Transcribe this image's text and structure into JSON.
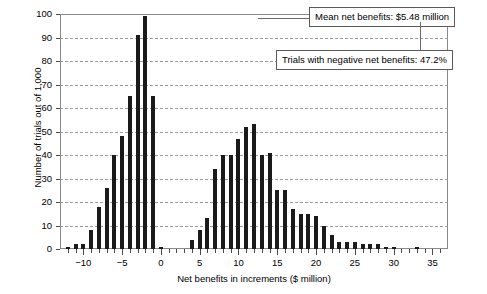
{
  "chart_data": {
    "type": "bar",
    "title": "",
    "subtitle": "",
    "xlabel": "Net benefits in increments ($ million)",
    "ylabel": "Number of trials out of 1,000",
    "xlim": [
      -13,
      37
    ],
    "ylim": [
      0,
      100
    ],
    "grid": true,
    "legend_position": "none",
    "x_tick_labels": [
      "-10",
      "-5",
      "0",
      "5",
      "10",
      "15",
      "20",
      "25",
      "30",
      "35"
    ],
    "x_tick_values": [
      -10,
      -5,
      0,
      5,
      10,
      15,
      20,
      25,
      30,
      35
    ],
    "x_minor_tick_step": 1,
    "y_tick_labels": [
      "0",
      "10",
      "20",
      "30",
      "40",
      "50",
      "60",
      "70",
      "80",
      "90",
      "100"
    ],
    "y_tick_values": [
      0,
      10,
      20,
      30,
      40,
      50,
      60,
      70,
      80,
      90,
      100
    ],
    "bar_color": "#1a1a1a",
    "x": [
      -12,
      -11,
      -10,
      -9,
      -8,
      -7,
      -6,
      -5,
      -4,
      -3,
      -2,
      -1,
      0,
      1,
      2,
      3,
      4,
      5,
      6,
      7,
      8,
      9,
      10,
      11,
      12,
      13,
      14,
      15,
      16,
      17,
      18,
      19,
      20,
      21,
      22,
      23,
      24,
      25,
      26,
      27,
      28,
      29,
      30,
      31,
      32,
      33,
      34
    ],
    "values": [
      1,
      2,
      2,
      8,
      18,
      26,
      40,
      48,
      65,
      91,
      99,
      65,
      1,
      0,
      0,
      0,
      4,
      8,
      13,
      34,
      40,
      40,
      47,
      52,
      53,
      40,
      41,
      25,
      25,
      17,
      15,
      15,
      14,
      10,
      6,
      3,
      3,
      3,
      2,
      2,
      2,
      1,
      1,
      0,
      0,
      1,
      0
    ]
  },
  "annotations": [
    {
      "id": "mean-net-benefits",
      "text": "Mean net benefits: $5.48 million"
    },
    {
      "id": "negative-net-benefits",
      "text": "Trials with negative net benefits: 47.2%"
    }
  ]
}
